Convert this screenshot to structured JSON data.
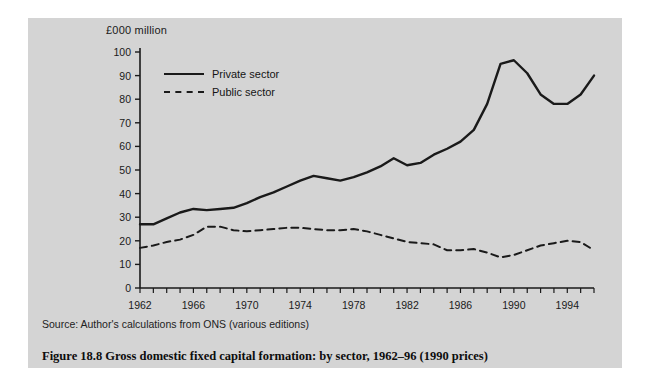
{
  "figure": {
    "unit_label": "£000 million",
    "source": "Source: Author's calculations from ONS (various editions)",
    "caption": "Figure 18.8  Gross domestic fixed capital formation: by sector, 1962–96 (1990 prices)",
    "panel_color": "#d4d4d4",
    "line_color": "#1a1a1a"
  },
  "legend": {
    "items": [
      {
        "label": "Private sector",
        "style": "solid"
      },
      {
        "label": "Public sector",
        "style": "dashed"
      }
    ]
  },
  "chart_data": {
    "type": "line",
    "title": "Gross domestic fixed capital formation: by sector, 1962–96 (1990 prices)",
    "xlabel": "",
    "ylabel": "£000 million",
    "xlim": [
      1962,
      1996
    ],
    "ylim": [
      0,
      100
    ],
    "yticks": [
      0,
      10,
      20,
      30,
      40,
      50,
      60,
      70,
      80,
      90,
      100
    ],
    "ytick_labels": [
      "0",
      "10",
      "20",
      "30",
      "40",
      "50",
      "60",
      "70",
      "80",
      "90",
      "100"
    ],
    "xticks_labeled": [
      1962,
      1966,
      1970,
      1974,
      1978,
      1982,
      1986,
      1990,
      1994
    ],
    "xtick_labels": [
      "1962",
      "1966",
      "1970",
      "1974",
      "1978",
      "1982",
      "1986",
      "1990",
      "1994"
    ],
    "xtick_minor_every": 1,
    "grid": false,
    "legend_position": "upper-left-inside",
    "x": [
      1962,
      1963,
      1964,
      1965,
      1966,
      1967,
      1968,
      1969,
      1970,
      1971,
      1972,
      1973,
      1974,
      1975,
      1976,
      1977,
      1978,
      1979,
      1980,
      1981,
      1982,
      1983,
      1984,
      1985,
      1986,
      1987,
      1988,
      1989,
      1990,
      1991,
      1992,
      1993,
      1994,
      1995,
      1996
    ],
    "series": [
      {
        "name": "Private sector",
        "style": "solid",
        "values": [
          27,
          27,
          29.5,
          32,
          33.5,
          33,
          33.5,
          34,
          36,
          38.5,
          40.5,
          43,
          45.5,
          47.5,
          46.5,
          45.5,
          47,
          49,
          51.5,
          55,
          52,
          53,
          56.5,
          59,
          62,
          67,
          78,
          95,
          96.5,
          91,
          82,
          78,
          78,
          82,
          90
        ]
      },
      {
        "name": "Public sector",
        "style": "dashed",
        "values": [
          17,
          18,
          19.5,
          20.5,
          22.5,
          26,
          26,
          24.5,
          24,
          24.5,
          25,
          25.5,
          25.5,
          25,
          24.5,
          24.5,
          25,
          24,
          22.5,
          21,
          19.5,
          19,
          18.5,
          16,
          16,
          16.5,
          15,
          13,
          14,
          16,
          18,
          19,
          20,
          19.5,
          16
        ]
      }
    ]
  }
}
